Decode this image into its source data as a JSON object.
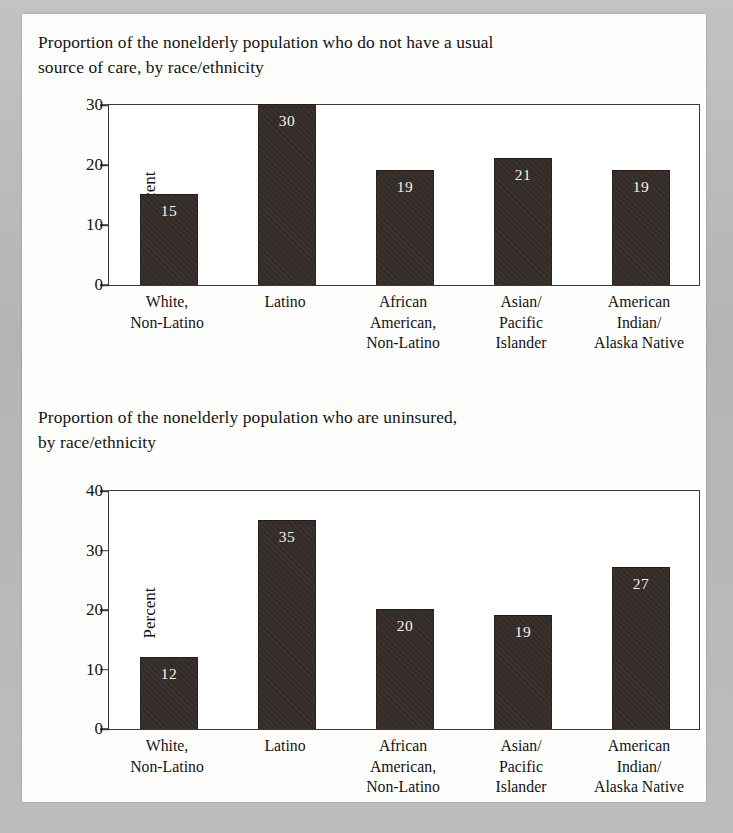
{
  "document": {
    "page_background": "#fdfdfc",
    "scan_border_color": "#b9b9b7",
    "bar_color": "#332b28",
    "axis_color": "#3a3936",
    "text_color": "#141414",
    "value_label_color": "#f4f2ee"
  },
  "figures": [
    {
      "title": "Proportion of the nonelderly population who do not have a usual\nsource of care, by race/ethnicity",
      "chart_data": {
        "type": "bar",
        "title": "Proportion of the nonelderly population who do not have a usual source of care, by race/ethnicity",
        "xlabel": "",
        "ylabel": "Percent",
        "ylim": [
          0,
          30
        ],
        "yticks": [
          0,
          10,
          20,
          30
        ],
        "ytick_labels": [
          "0",
          "10",
          "20",
          "30"
        ],
        "grid": false,
        "legend": "none",
        "categories": [
          "White,\nNon-Latino",
          "Latino",
          "African\nAmerican,\nNon-Latino",
          "Asian/\nPacific\nIslander",
          "American\nIndian/\nAlaska Native"
        ],
        "values": [
          15,
          30,
          19,
          21,
          19
        ],
        "value_labels": [
          "15",
          "30",
          "19",
          "21",
          "19"
        ]
      }
    },
    {
      "title": "Proportion of the nonelderly population who are uninsured,\nby race/ethnicity",
      "chart_data": {
        "type": "bar",
        "title": "Proportion of the nonelderly population who are uninsured, by race/ethnicity",
        "xlabel": "",
        "ylabel": "Percent",
        "ylim": [
          0,
          40
        ],
        "yticks": [
          0,
          10,
          20,
          30,
          40
        ],
        "ytick_labels": [
          "0",
          "10",
          "20",
          "30",
          "40"
        ],
        "grid": false,
        "legend": "none",
        "categories": [
          "White,\nNon-Latino",
          "Latino",
          "African\nAmerican,\nNon-Latino",
          "Asian/\nPacific\nIslander",
          "American\nIndian/\nAlaska Native"
        ],
        "values": [
          12,
          35,
          20,
          19,
          27
        ],
        "value_labels": [
          "12",
          "35",
          "20",
          "19",
          "27"
        ]
      }
    }
  ]
}
